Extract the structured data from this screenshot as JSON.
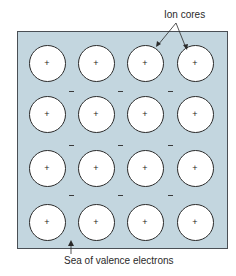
{
  "diagram": {
    "type": "metallic-bonding-electron-sea-model",
    "labels": {
      "ion_cores": "Ion cores",
      "sea": "Sea of valence electrons"
    },
    "ion_symbol": "+",
    "electron_symbol": "−",
    "grid": {
      "rows": 4,
      "columns": 4
    },
    "colors": {
      "sea_background": "#c3d6df",
      "ion_fill": "#ffffff",
      "outline": "#2b2b2b"
    }
  }
}
